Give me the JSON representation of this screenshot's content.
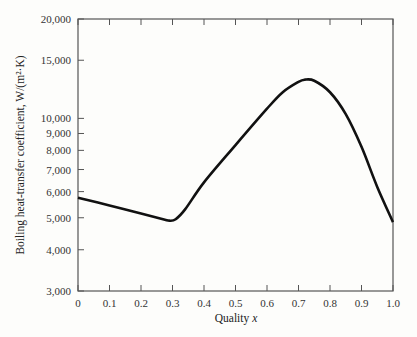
{
  "chart_data": {
    "type": "line",
    "title": "",
    "xlabel": "Quality x",
    "ylabel": "Boiling heat-transfer coefficient, W/(m²·K)",
    "xlim": [
      0,
      1.0
    ],
    "ylim": [
      3000,
      20000
    ],
    "yscale": "log",
    "grid": false,
    "x_ticks": [
      "0",
      "0.1",
      "0.2",
      "0.3",
      "0.4",
      "0.5",
      "0.6",
      "0.7",
      "0.8",
      "0.9",
      "1.0"
    ],
    "y_ticks": [
      "3,000",
      "4,000",
      "5,000",
      "6,000",
      "7,000",
      "8,000",
      "9,000",
      "10,000",
      "15,000",
      "20,000"
    ],
    "series": [
      {
        "name": "Boiling heat-transfer coefficient",
        "x": [
          0,
          0.1,
          0.2,
          0.27,
          0.29,
          0.31,
          0.34,
          0.4,
          0.5,
          0.6,
          0.65,
          0.7,
          0.72,
          0.75,
          0.8,
          0.85,
          0.9,
          0.95,
          1.0
        ],
        "y": [
          5750,
          5450,
          5150,
          4950,
          4900,
          4950,
          5300,
          6400,
          8300,
          10700,
          12000,
          12900,
          13100,
          13000,
          12000,
          10300,
          8200,
          6200,
          4850
        ]
      }
    ]
  }
}
